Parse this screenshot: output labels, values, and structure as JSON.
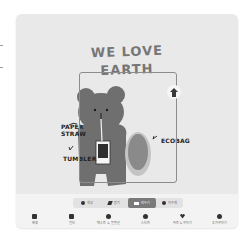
{
  "canvas": {
    "title_line1": "WE LOVE",
    "title_line2": "EARTH",
    "labels": {
      "paper": "PAPER",
      "straw": "STRAW",
      "ecobag": "ECOBAG",
      "tumbler": "TUMBLER"
    },
    "colors": {
      "background": "#e9e9e9",
      "bear": "#6f6f6f",
      "title": "#767676",
      "bag": "#b9b9b9"
    }
  },
  "mode_bar": {
    "items": [
      {
        "label": "색상",
        "icon": "circle-icon",
        "active": false
      },
      {
        "label": "밝기",
        "icon": "pen-icon",
        "active": false
      },
      {
        "label": "테두리",
        "icon": "square-icon",
        "active": true
      },
      {
        "label": "지우개",
        "icon": "eraser-icon",
        "active": false
      }
    ]
  },
  "toolbar": {
    "items": [
      {
        "label": "배경",
        "icon": "image-icon"
      },
      {
        "label": "필터",
        "icon": "filter-icon"
      },
      {
        "label": "텍스트 & 말풍선",
        "icon": "text-icon"
      },
      {
        "label": "스티커",
        "icon": "sticker-icon"
      },
      {
        "label": "하트 & 꾸미기",
        "icon": "heart-icon"
      },
      {
        "label": "추가 꾸미기",
        "icon": "add-icon"
      }
    ]
  }
}
